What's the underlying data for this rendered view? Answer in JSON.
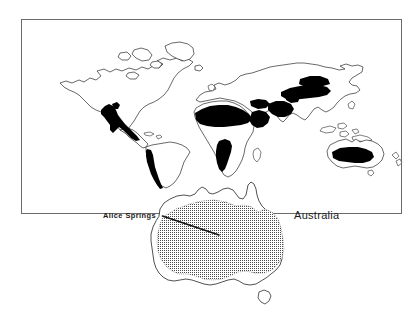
{
  "figure": {
    "type": "distribution-map",
    "background_color": "#ffffff",
    "ink_color": "#1a1a1a",
    "fill_color": "#000000",
    "stipple_color": "#555555",
    "world_panel": {
      "name": "world-distribution-map",
      "frame": {
        "x": 21,
        "y": 19,
        "width": 381,
        "height": 195,
        "stroke_color": "#555555",
        "stroke_width": 1
      },
      "projection_note": "world outline, solid black = distribution range",
      "filled_regions": [
        "southwestern-north-america",
        "andes-western-south-america",
        "sahara-north-africa",
        "horn-of-africa-arabia",
        "southwest-asia-iran",
        "central-asia",
        "southern-africa-namib-kalahari",
        "australia-interior"
      ]
    },
    "australia_panel": {
      "name": "australia-inset-map",
      "stipple_region_label": "arid-zone",
      "includes_tasmania": true
    },
    "labels": {
      "alice_springs": "Alice Springs",
      "australia": "Australia"
    },
    "leader_line": {
      "name": "alice-springs-leader-line",
      "from_x": 163,
      "from_y": 216,
      "to_x": 219,
      "to_y": 235,
      "stroke_width": 1.6
    }
  }
}
